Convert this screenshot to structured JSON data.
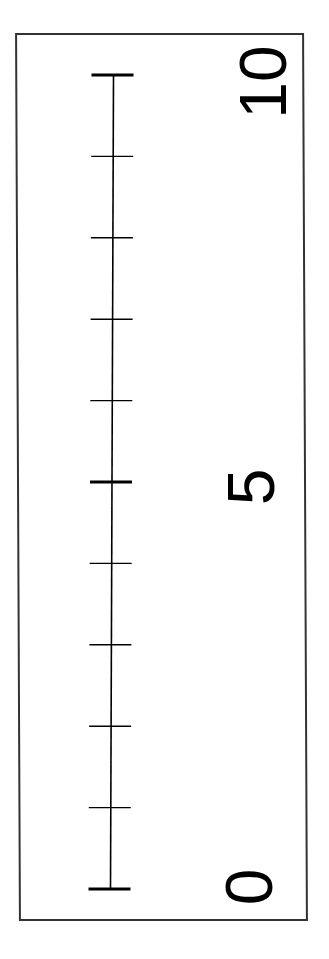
{
  "number_line": {
    "min": 0,
    "max": 10,
    "tick_values": [
      0,
      1,
      2,
      3,
      4,
      5,
      6,
      7,
      8,
      9,
      10
    ],
    "major_ticks": [
      0,
      5,
      10
    ],
    "orientation": "vertical-rotated",
    "line_color": "#000000",
    "border_color": "#333333"
  },
  "labels": {
    "zero": "0",
    "five": "5",
    "ten": "10"
  }
}
